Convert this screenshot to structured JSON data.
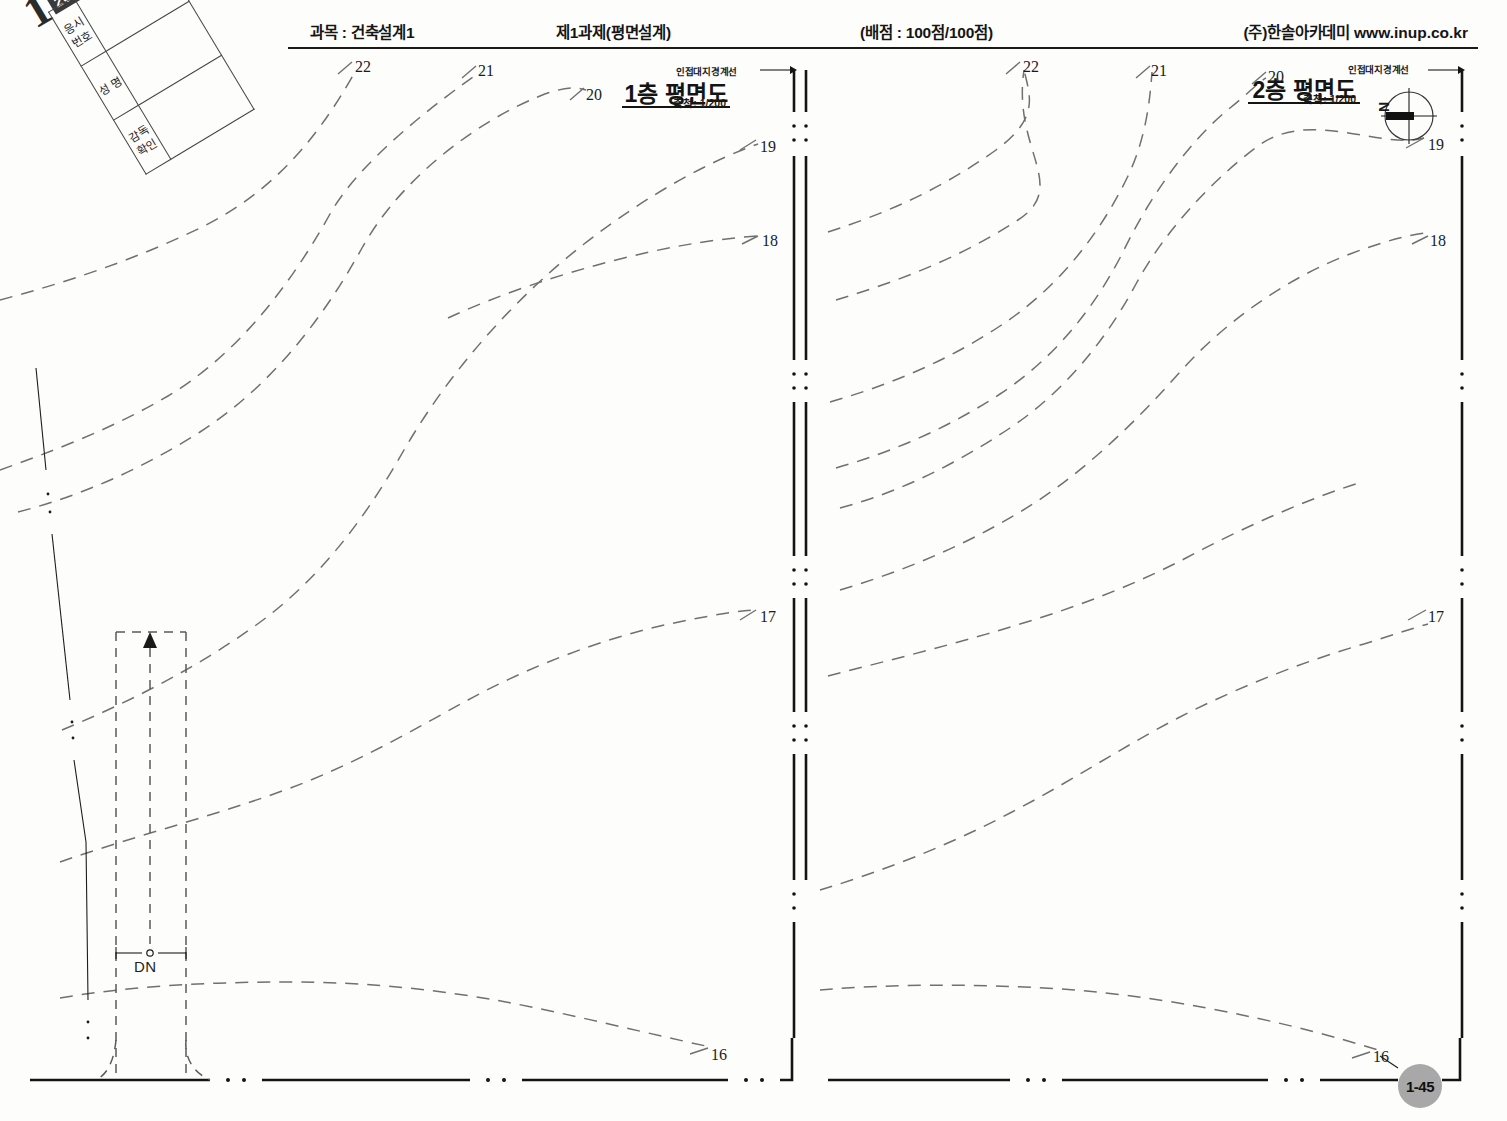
{
  "header": {
    "subject": "과목 : 건축설계1",
    "task": "제1과제(평면설계)",
    "score": "(배점 : 100점/100점)",
    "brand": "(주)한솔아카데미",
    "url": "www.inup.co.kr"
  },
  "exam_id_block": {
    "number": "1",
    "year": "2012",
    "rows": [
      {
        "label": "응시번호",
        "value": ""
      },
      {
        "label": "성  명",
        "value": ""
      },
      {
        "label": "감독확인",
        "value": ""
      }
    ]
  },
  "plans": [
    {
      "title": "1층 평면도",
      "scale": "축척: 1/200",
      "boundary_note": "인접대지경계선"
    },
    {
      "title": "2층 평면도",
      "scale": "축척: 1/200",
      "boundary_note": "인접대지경계선",
      "north_letter": "N"
    }
  ],
  "stair_marker": {
    "label": "DN"
  },
  "page_badge": {
    "label": "1-45"
  },
  "chart_data": {
    "type": "contour-map",
    "unit": "m",
    "contour_interval": 1,
    "elevations": [
      16,
      17,
      18,
      19,
      20,
      21,
      22
    ],
    "left_plan_labels": [
      {
        "value": "22",
        "x": 355,
        "y": 58
      },
      {
        "value": "21",
        "x": 478,
        "y": 62
      },
      {
        "value": "20",
        "x": 586,
        "y": 86
      },
      {
        "value": "19",
        "x": 760,
        "y": 138
      },
      {
        "value": "18",
        "x": 762,
        "y": 232
      },
      {
        "value": "17",
        "x": 760,
        "y": 608
      },
      {
        "value": "16",
        "x": 711,
        "y": 1046
      }
    ],
    "right_plan_labels": [
      {
        "value": "22",
        "x": 1023,
        "y": 58
      },
      {
        "value": "21",
        "x": 1151,
        "y": 62
      },
      {
        "value": "20",
        "x": 1268,
        "y": 68
      },
      {
        "value": "19",
        "x": 1428,
        "y": 136
      },
      {
        "value": "18",
        "x": 1430,
        "y": 232
      },
      {
        "value": "17",
        "x": 1428,
        "y": 608
      },
      {
        "value": "16",
        "x": 1373,
        "y": 1048
      }
    ]
  },
  "colors": {
    "ink": "#1a1a1a",
    "contour": "#6f6f6f",
    "badge": "#a8a8a8",
    "paper": "#fdfdfc"
  }
}
